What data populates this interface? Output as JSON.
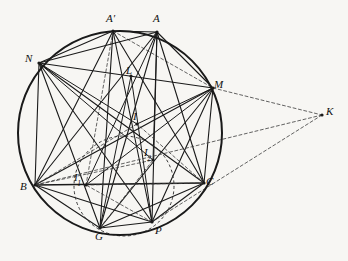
{
  "figure": {
    "type": "euclidean-geometry-diagram",
    "caption": "",
    "background_color": "#f7f6f3",
    "ink_color": "#1a1a1a",
    "canvas": {
      "width": 348,
      "height": 261
    }
  },
  "circumcircle": {
    "name": "main-circumcircle",
    "center": {
      "x": 120,
      "y": 133
    },
    "radius": 102,
    "stroke": "#1a1a1a",
    "stroke_width": 2.0,
    "style": "solid"
  },
  "auxiliary_circle": {
    "name": "auxiliary-dashed-circle",
    "center": {
      "x": 124,
      "y": 186
    },
    "radius": 50,
    "stroke": "#3a3a3a",
    "stroke_width": 1.0,
    "style": "dashed",
    "dash_pattern": "3,2.5"
  },
  "points": [
    {
      "id": "Aprime",
      "label": "A",
      "prime": true,
      "sub": "",
      "x": 113,
      "y": 31,
      "label_x": 106,
      "label_y": 13,
      "on_circle": true
    },
    {
      "id": "A",
      "label": "A",
      "prime": false,
      "sub": "",
      "x": 157,
      "y": 32,
      "label_x": 153,
      "label_y": 13,
      "on_circle": true
    },
    {
      "id": "N",
      "label": "N",
      "prime": false,
      "sub": "",
      "x": 39,
      "y": 63,
      "label_x": 25,
      "label_y": 53,
      "on_circle": true
    },
    {
      "id": "M",
      "label": "M",
      "prime": false,
      "sub": "",
      "x": 213,
      "y": 88,
      "label_x": 214,
      "label_y": 79,
      "on_circle": true
    },
    {
      "id": "B",
      "label": "B",
      "prime": false,
      "sub": "",
      "x": 35,
      "y": 185,
      "label_x": 20,
      "label_y": 181,
      "on_circle": true
    },
    {
      "id": "C",
      "label": "C",
      "prime": false,
      "sub": "",
      "x": 204,
      "y": 183,
      "label_x": 206,
      "label_y": 176,
      "on_circle": true
    },
    {
      "id": "G",
      "label": "G",
      "prime": false,
      "sub": "",
      "x": 100,
      "y": 228,
      "label_x": 95,
      "label_y": 231,
      "on_circle": true
    },
    {
      "id": "P",
      "label": "P",
      "prime": false,
      "sub": "",
      "x": 152,
      "y": 222,
      "label_x": 155,
      "label_y": 225,
      "on_circle": true
    },
    {
      "id": "K",
      "label": "K",
      "prime": false,
      "sub": "",
      "x": 322,
      "y": 115,
      "label_x": 326,
      "label_y": 106,
      "on_circle": false
    },
    {
      "id": "L",
      "label": "L",
      "prime": false,
      "sub": "",
      "x": 131,
      "y": 76,
      "label_x": 126,
      "label_y": 65,
      "on_circle": false
    },
    {
      "id": "I",
      "label": "I",
      "prime": false,
      "sub": "",
      "x": 137,
      "y": 124,
      "label_x": 133,
      "label_y": 111,
      "on_circle": false
    },
    {
      "id": "I1",
      "label": "I",
      "prime": false,
      "sub": "1",
      "x": 86,
      "y": 185,
      "label_x": 74,
      "label_y": 172,
      "on_circle": false
    },
    {
      "id": "I2",
      "label": "I",
      "prime": false,
      "sub": "2",
      "x": 153,
      "y": 160,
      "label_x": 144,
      "label_y": 147,
      "on_circle": false
    }
  ],
  "segments": [
    {
      "from": "Aprime",
      "to": "A",
      "style": "solid",
      "weight": 1.1
    },
    {
      "from": "Aprime",
      "to": "N",
      "style": "solid",
      "weight": 1.1
    },
    {
      "from": "Aprime",
      "to": "M",
      "style": "dashed",
      "weight": 0.8
    },
    {
      "from": "Aprime",
      "to": "B",
      "style": "solid",
      "weight": 1.1
    },
    {
      "from": "Aprime",
      "to": "C",
      "style": "solid",
      "weight": 1.1
    },
    {
      "from": "Aprime",
      "to": "G",
      "style": "solid",
      "weight": 1.1
    },
    {
      "from": "Aprime",
      "to": "P",
      "style": "solid",
      "weight": 1.1
    },
    {
      "from": "Aprime",
      "to": "I1",
      "style": "dashed",
      "weight": 0.8
    },
    {
      "from": "A",
      "to": "N",
      "style": "solid",
      "weight": 1.1
    },
    {
      "from": "A",
      "to": "M",
      "style": "solid",
      "weight": 1.1
    },
    {
      "from": "A",
      "to": "B",
      "style": "solid",
      "weight": 1.1
    },
    {
      "from": "A",
      "to": "C",
      "style": "solid",
      "weight": 1.1
    },
    {
      "from": "A",
      "to": "G",
      "style": "solid",
      "weight": 1.1
    },
    {
      "from": "A",
      "to": "P",
      "style": "solid",
      "weight": 1.1
    },
    {
      "from": "A",
      "to": "I1",
      "style": "solid",
      "weight": 1.0
    },
    {
      "from": "A",
      "to": "I2",
      "style": "solid",
      "weight": 1.0
    },
    {
      "from": "N",
      "to": "M",
      "style": "solid",
      "weight": 1.2
    },
    {
      "from": "N",
      "to": "B",
      "style": "solid",
      "weight": 1.1
    },
    {
      "from": "N",
      "to": "C",
      "style": "solid",
      "weight": 1.1
    },
    {
      "from": "N",
      "to": "G",
      "style": "solid",
      "weight": 1.1
    },
    {
      "from": "N",
      "to": "P",
      "style": "solid",
      "weight": 1.1
    },
    {
      "from": "N",
      "to": "I",
      "style": "solid",
      "weight": 1.0
    },
    {
      "from": "N",
      "to": "I2",
      "style": "solid",
      "weight": 1.0
    },
    {
      "from": "M",
      "to": "B",
      "style": "solid",
      "weight": 1.2
    },
    {
      "from": "M",
      "to": "C",
      "style": "solid",
      "weight": 1.1
    },
    {
      "from": "M",
      "to": "G",
      "style": "solid",
      "weight": 1.1
    },
    {
      "from": "M",
      "to": "P",
      "style": "solid",
      "weight": 1.1
    },
    {
      "from": "M",
      "to": "I",
      "style": "solid",
      "weight": 1.0
    },
    {
      "from": "M",
      "to": "I1",
      "style": "solid",
      "weight": 1.0
    },
    {
      "from": "B",
      "to": "C",
      "style": "solid",
      "weight": 1.4
    },
    {
      "from": "B",
      "to": "G",
      "style": "solid",
      "weight": 1.1
    },
    {
      "from": "B",
      "to": "P",
      "style": "solid",
      "weight": 1.1
    },
    {
      "from": "B",
      "to": "I",
      "style": "dashed",
      "weight": 0.8
    },
    {
      "from": "B",
      "to": "I2",
      "style": "dashed",
      "weight": 0.8
    },
    {
      "from": "C",
      "to": "G",
      "style": "solid",
      "weight": 1.1
    },
    {
      "from": "C",
      "to": "P",
      "style": "solid",
      "weight": 1.1
    },
    {
      "from": "C",
      "to": "I",
      "style": "dashed",
      "weight": 0.8
    },
    {
      "from": "C",
      "to": "I1",
      "style": "dashed",
      "weight": 0.8
    },
    {
      "from": "G",
      "to": "P",
      "style": "solid",
      "weight": 1.1
    },
    {
      "from": "G",
      "to": "L",
      "style": "solid",
      "weight": 1.0
    },
    {
      "from": "P",
      "to": "L",
      "style": "solid",
      "weight": 1.0
    },
    {
      "from": "G",
      "to": "I2",
      "style": "dashed",
      "weight": 0.8
    },
    {
      "from": "P",
      "to": "I1",
      "style": "dashed",
      "weight": 0.8
    },
    {
      "from": "M",
      "to": "K",
      "style": "dashed",
      "weight": 0.8
    },
    {
      "from": "K",
      "to": "B",
      "style": "dashed",
      "weight": 0.8
    },
    {
      "from": "K",
      "to": "P",
      "style": "dashed",
      "weight": 0.8
    }
  ]
}
